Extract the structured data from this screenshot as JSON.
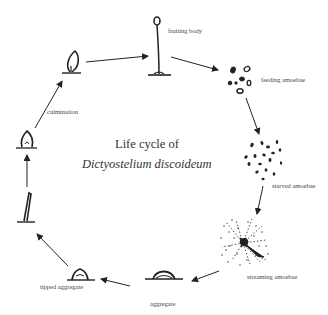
{
  "title": {
    "line1": "Life cycle of",
    "line2": "Dictyostelium discoideum"
  },
  "stages": [
    {
      "id": "fruiting-body",
      "label": "fruiting body"
    },
    {
      "id": "feeding-amoebae",
      "label": "feeding amoebae"
    },
    {
      "id": "starved-amoebae",
      "label": "starved amoebae"
    },
    {
      "id": "streaming-amoebae",
      "label": "streaming amoebae"
    },
    {
      "id": "aggregate",
      "label": "aggregate"
    },
    {
      "id": "tipped-aggregate",
      "label": "tipped aggregate"
    },
    {
      "id": "slug",
      "label": ""
    },
    {
      "id": "early-culmination",
      "label": ""
    },
    {
      "id": "culmination",
      "label": "culmination"
    }
  ],
  "cycle_order": [
    "fruiting body",
    "feeding amoebae",
    "starved amoebae",
    "streaming amoebae",
    "aggregate",
    "tipped aggregate",
    "slug",
    "early culmination",
    "culmination",
    "fruiting body"
  ],
  "colors": {
    "ink": "#222222",
    "label": "#444444",
    "background": "#ffffff"
  }
}
